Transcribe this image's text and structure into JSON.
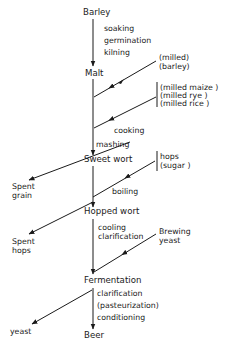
{
  "diagram": {
    "type": "flow",
    "colors": {
      "line": "#1a1a1a",
      "background": "#ffffff",
      "text": "#1a1a1a"
    },
    "nodes": {
      "barley": "Barley",
      "malt": "Malt",
      "sweet_wort": "Sweet wort",
      "hopped_wort": "Hopped wort",
      "fermentation": "Fermentation",
      "beer": "Beer"
    },
    "steps": {
      "barley_to_malt": [
        "soaking",
        "germination",
        "kilning"
      ],
      "cooking": "cooking",
      "mashing": "mashing",
      "boiling": "boiling",
      "hopped_to_fermentation": [
        "cooling",
        "clarification"
      ],
      "fermentation_to_beer": [
        "clarification",
        "(pasteurization)",
        "conditioning"
      ]
    },
    "inputs": {
      "milled_barley": [
        "(milled)",
        "(barley)"
      ],
      "adjuncts": [
        "(milled maize )",
        "(milled rye )",
        "(milled rice )"
      ],
      "hops": [
        "hops",
        "(sugar )"
      ],
      "brewing_yeast": [
        "Brewing",
        "yeast"
      ]
    },
    "outputs": {
      "spent_grain": [
        "Spent",
        "grain"
      ],
      "spent_hops": [
        "Spent",
        "hops"
      ],
      "yeast": "yeast"
    }
  }
}
